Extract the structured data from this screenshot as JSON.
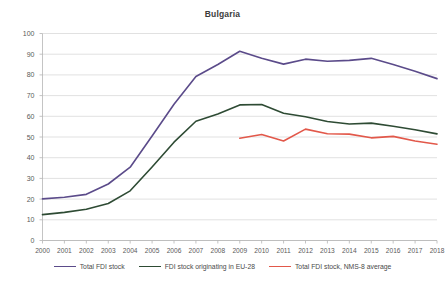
{
  "chart_data": {
    "type": "line",
    "title": "Bulgaria",
    "xlabel": "",
    "ylabel": "",
    "ylim": [
      0,
      100
    ],
    "ytick_step": 10,
    "yticks": [
      100,
      90,
      80,
      70,
      60,
      50,
      40,
      30,
      20,
      10,
      0
    ],
    "grid": true,
    "legend_position": "bottom",
    "categories": [
      "2000",
      "2001",
      "2002",
      "2003",
      "2004",
      "2005",
      "2006",
      "2007",
      "2008",
      "2009",
      "2010",
      "2011",
      "2012",
      "2013",
      "2014",
      "2015",
      "2016",
      "2017",
      "2018"
    ],
    "series": [
      {
        "name": "Total FDI stock",
        "color": "#5B4B8A",
        "values": [
          20.1,
          20.9,
          22.3,
          27.3,
          35.4,
          50.5,
          65.8,
          79.2,
          85.0,
          91.4,
          88.0,
          85.2,
          87.6,
          86.6,
          87.0,
          88.0,
          85.0,
          81.8,
          78.2
        ]
      },
      {
        "name": "FDI stock originating in EU-28",
        "color": "#2E4B34",
        "values": [
          12.5,
          13.6,
          15.1,
          17.9,
          24.0,
          35.5,
          47.5,
          57.6,
          61.1,
          65.5,
          65.7,
          61.5,
          59.8,
          57.5,
          56.3,
          56.7,
          55.2,
          53.5,
          51.5
        ]
      },
      {
        "name": "Total FDI stock, NMS-8 average",
        "color": "#E2584A",
        "start_category": "2009",
        "values": [
          null,
          null,
          null,
          null,
          null,
          null,
          null,
          null,
          null,
          49.4,
          51.2,
          48.1,
          53.8,
          51.6,
          51.4,
          49.6,
          50.3,
          48.1,
          46.5
        ]
      }
    ]
  },
  "legend": {
    "items": [
      {
        "label": "Total FDI stock"
      },
      {
        "label": "FDI stock originating in EU-28"
      },
      {
        "label": "Total FDI stock, NMS-8 average"
      }
    ]
  }
}
